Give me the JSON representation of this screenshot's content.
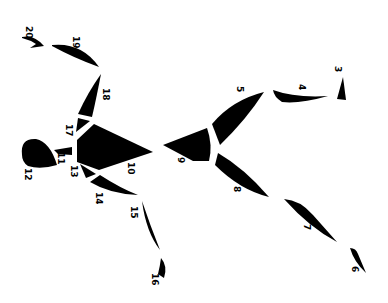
{
  "diagram": {
    "ink_color": "#000000",
    "background": "#ffffff",
    "segments": [
      {
        "id": 3,
        "label": "3"
      },
      {
        "id": 4,
        "label": "4"
      },
      {
        "id": 5,
        "label": "5"
      },
      {
        "id": 6,
        "label": "6"
      },
      {
        "id": 7,
        "label": "7"
      },
      {
        "id": 8,
        "label": "8"
      },
      {
        "id": 9,
        "label": "9"
      },
      {
        "id": 10,
        "label": "10"
      },
      {
        "id": 11,
        "label": "11"
      },
      {
        "id": 12,
        "label": "12"
      },
      {
        "id": 13,
        "label": "13"
      },
      {
        "id": 14,
        "label": "14"
      },
      {
        "id": 15,
        "label": "15"
      },
      {
        "id": 16,
        "label": "16"
      },
      {
        "id": 17,
        "label": "17"
      },
      {
        "id": 18,
        "label": "18"
      },
      {
        "id": 19,
        "label": "19"
      },
      {
        "id": 20,
        "label": "20"
      }
    ]
  }
}
